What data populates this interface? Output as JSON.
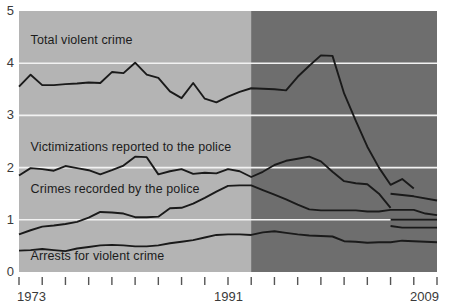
{
  "chart_data": {
    "type": "line",
    "title": "",
    "subtitle": "",
    "xlabel": "",
    "ylabel": "",
    "xlim": [
      1973,
      2009
    ],
    "ylim": [
      0,
      5
    ],
    "grid": true,
    "gridlines_y": [
      1,
      2,
      3,
      4
    ],
    "legend_position": "inline-labels",
    "y_tick_labels": [
      "0",
      "1",
      "2",
      "3",
      "4",
      "5"
    ],
    "y_tick_values": [
      0,
      1,
      2,
      3,
      4,
      5
    ],
    "x_tick_labels": [
      "1973",
      "1991",
      "2009"
    ],
    "x_tick_values": [
      1973,
      1991,
      2009
    ],
    "x_tick_marks": [
      1973,
      1975,
      1977,
      1979,
      1981,
      1983,
      1985,
      1987,
      1989,
      1991,
      1993,
      1995,
      1997,
      1999,
      2001,
      2003,
      2005,
      2007,
      2009
    ],
    "shaded_region": {
      "label": "",
      "from": 1993,
      "to": 2009,
      "color": "#6e6e6e"
    },
    "plot_background": "#b4b4b4",
    "gridline_color": "#f2f2f2",
    "line_color": "#1a1a1a",
    "series": [
      {
        "name": "Total violent crime",
        "label": "Total violent crime",
        "label_x": 1974,
        "label_y": 4.42,
        "x": [
          1973,
          1974,
          1975,
          1976,
          1977,
          1978,
          1979,
          1980,
          1981,
          1982,
          1983,
          1984,
          1985,
          1986,
          1987,
          1988,
          1989,
          1990,
          1991,
          1992,
          1993,
          1994,
          1995,
          1996,
          1997,
          1998,
          1999,
          2000,
          2001,
          2002,
          2003,
          2004,
          2005,
          2006,
          2007
        ],
        "values": [
          3.55,
          3.78,
          3.58,
          3.58,
          3.6,
          3.61,
          3.63,
          3.62,
          3.83,
          3.81,
          4.01,
          3.78,
          3.72,
          3.46,
          3.33,
          3.62,
          3.32,
          3.25,
          3.36,
          3.45,
          3.52,
          3.51,
          3.5,
          3.48,
          3.74,
          3.95,
          4.15,
          4.14,
          3.42,
          2.9,
          2.4,
          2.0,
          1.67,
          1.78,
          1.6
        ]
      },
      {
        "name": "Victimizations reported to the police",
        "label": "Victimizations reported to the police",
        "label_x": 1974,
        "label_y": 2.38,
        "x": [
          1973,
          1974,
          1975,
          1976,
          1977,
          1978,
          1979,
          1980,
          1981,
          1982,
          1983,
          1984,
          1985,
          1986,
          1987,
          1988,
          1989,
          1990,
          1991,
          1992,
          1993,
          1994,
          1995,
          1996,
          1997,
          1998,
          1999,
          2000,
          2001,
          2002,
          2003,
          2004,
          2005
        ],
        "values": [
          1.85,
          1.99,
          1.97,
          1.94,
          2.03,
          1.99,
          1.95,
          1.87,
          1.95,
          2.04,
          2.21,
          2.2,
          1.87,
          1.93,
          1.97,
          1.88,
          1.9,
          1.89,
          1.97,
          1.93,
          1.82,
          1.92,
          2.05,
          2.13,
          2.17,
          2.21,
          2.12,
          1.92,
          1.74,
          1.7,
          1.68,
          1.5,
          1.23
        ]
      },
      {
        "name": "Crimes recorded by the police",
        "label": "Crimes recorded by the police",
        "label_x": 1974,
        "label_y": 1.57,
        "x": [
          1973,
          1974,
          1975,
          1976,
          1977,
          1978,
          1979,
          1980,
          1981,
          1982,
          1983,
          1984,
          1985,
          1986,
          1987,
          1988,
          1989,
          1990,
          1991,
          1992,
          1993,
          1994,
          1995,
          1996,
          1997,
          1998,
          1999,
          2000,
          2001,
          2002,
          2003,
          2004,
          2005,
          2006,
          2007,
          2008,
          2009
        ],
        "values": [
          0.72,
          0.8,
          0.87,
          0.89,
          0.92,
          0.96,
          1.04,
          1.15,
          1.14,
          1.12,
          1.05,
          1.05,
          1.06,
          1.22,
          1.23,
          1.31,
          1.42,
          1.54,
          1.65,
          1.66,
          1.66,
          1.57,
          1.48,
          1.39,
          1.29,
          1.2,
          1.18,
          1.18,
          1.18,
          1.18,
          1.16,
          1.16,
          1.19,
          1.19,
          1.19,
          1.12,
          1.09
        ]
      },
      {
        "name": "Arrests for violent crime",
        "label": "Arrests for violent crime",
        "label_x": 1974,
        "label_y": 0.28,
        "x": [
          1973,
          1974,
          1975,
          1976,
          1977,
          1978,
          1979,
          1980,
          1981,
          1982,
          1983,
          1984,
          1985,
          1986,
          1987,
          1988,
          1989,
          1990,
          1991,
          1992,
          1993,
          1994,
          1995,
          1996,
          1997,
          1998,
          1999,
          2000,
          2001,
          2002,
          2003,
          2004,
          2005,
          2006,
          2007,
          2008,
          2009
        ],
        "values": [
          0.41,
          0.42,
          0.44,
          0.42,
          0.4,
          0.45,
          0.48,
          0.51,
          0.52,
          0.51,
          0.49,
          0.49,
          0.51,
          0.55,
          0.58,
          0.61,
          0.66,
          0.71,
          0.72,
          0.72,
          0.71,
          0.76,
          0.78,
          0.75,
          0.72,
          0.7,
          0.69,
          0.68,
          0.59,
          0.58,
          0.56,
          0.57,
          0.57,
          0.6,
          0.59,
          0.58,
          0.57
        ]
      }
    ],
    "extra_segments": [
      {
        "name": "crimes-recorded-revised",
        "x": [
          2005,
          2007,
          2009
        ],
        "values": [
          1.5,
          1.45,
          1.37
        ]
      },
      {
        "name": "victimizations-revised",
        "x": [
          2005,
          2006,
          2009
        ],
        "values": [
          1.0,
          1.0,
          1.0
        ]
      },
      {
        "name": "arrests-revised",
        "x": [
          2005,
          2006,
          2009
        ],
        "values": [
          0.88,
          0.85,
          0.85
        ]
      }
    ]
  }
}
